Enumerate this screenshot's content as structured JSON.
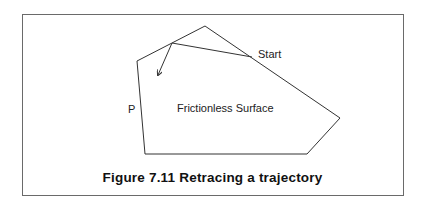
{
  "figure": {
    "caption": "Figure 7.11  Retracing a trajectory",
    "labels": {
      "start": "Start",
      "point": "P",
      "surface": "Frictionless Surface"
    },
    "polygon_points": "137,61 205,26 340,118 307,154 145,154",
    "trajectory_points": "252,57 172,43 158,75",
    "line_color": "#333333"
  }
}
